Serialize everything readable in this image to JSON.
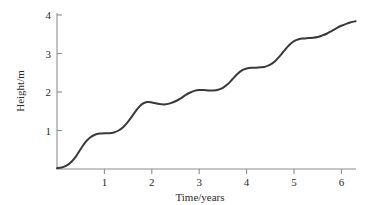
{
  "chart_data": {
    "type": "line",
    "title": "",
    "xlabel": "Time/years",
    "ylabel": "Height/m",
    "xlim": [
      0,
      6.4
    ],
    "ylim": [
      0,
      4.15
    ],
    "grid": false,
    "legend": null,
    "xticks": [
      1,
      2,
      3,
      4,
      5,
      6
    ],
    "xtick_labels": [
      "1",
      "2",
      "3",
      "4",
      "5",
      "6"
    ],
    "yticks": [
      1,
      2,
      3,
      4
    ],
    "ytick_labels": [
      "1",
      "2",
      "3",
      "4"
    ],
    "series": [
      {
        "name": "Height",
        "color": "#3a3a3a",
        "x": [
          0.0,
          0.1,
          0.2,
          0.3,
          0.4,
          0.5,
          0.6,
          0.7,
          0.8,
          0.9,
          1.0,
          1.1,
          1.2,
          1.3,
          1.4,
          1.5,
          1.6,
          1.7,
          1.8,
          1.9,
          2.0,
          2.1,
          2.2,
          2.3,
          2.4,
          2.5,
          2.6,
          2.7,
          2.8,
          2.9,
          3.0,
          3.1,
          3.2,
          3.3,
          3.4,
          3.5,
          3.6,
          3.7,
          3.8,
          3.9,
          4.0,
          4.1,
          4.2,
          4.3,
          4.4,
          4.5,
          4.6,
          4.7,
          4.8,
          4.9,
          5.0,
          5.1,
          5.2,
          5.3,
          5.4,
          5.5,
          5.6,
          5.7,
          5.8,
          5.9,
          6.0,
          6.1,
          6.2,
          6.3
        ],
        "y": [
          0.02,
          0.04,
          0.09,
          0.18,
          0.33,
          0.52,
          0.7,
          0.82,
          0.89,
          0.92,
          0.93,
          0.93,
          0.95,
          1.0,
          1.09,
          1.23,
          1.4,
          1.57,
          1.69,
          1.74,
          1.73,
          1.7,
          1.68,
          1.68,
          1.71,
          1.76,
          1.83,
          1.91,
          1.98,
          2.03,
          2.05,
          2.05,
          2.04,
          2.04,
          2.06,
          2.11,
          2.2,
          2.33,
          2.46,
          2.56,
          2.61,
          2.63,
          2.63,
          2.64,
          2.66,
          2.71,
          2.8,
          2.93,
          3.08,
          3.22,
          3.32,
          3.37,
          3.39,
          3.4,
          3.41,
          3.43,
          3.47,
          3.52,
          3.59,
          3.66,
          3.72,
          3.77,
          3.81,
          3.84
        ]
      }
    ],
    "annotations": []
  },
  "figure": {
    "xaxis_title": "Time/years",
    "yaxis_title": "Height/m"
  }
}
